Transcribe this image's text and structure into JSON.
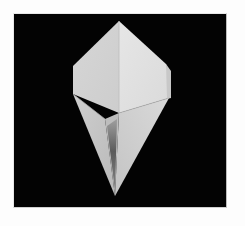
{
  "image": {
    "subject": "origami kite-base fold",
    "alt": "White folded paper origami shape pointed at top and bottom on a black background",
    "colors": {
      "background_border": "#fdfdfd",
      "photo_background": "#030303",
      "paper_light": "#e3e3e3",
      "paper_mid": "#cfcfcf",
      "paper_shadow": "#5a5a5a"
    }
  }
}
